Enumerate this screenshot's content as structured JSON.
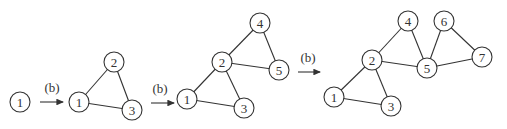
{
  "diagram": {
    "node_radius": 10,
    "stages": [
      {
        "nodes": [
          {
            "id": "1",
            "label": "1",
            "x": 20,
            "y": 102
          }
        ],
        "edges": []
      },
      {
        "nodes": [
          {
            "id": "1",
            "label": "1",
            "x": 79,
            "y": 102
          },
          {
            "id": "2",
            "label": "2",
            "x": 114,
            "y": 62
          },
          {
            "id": "3",
            "label": "3",
            "x": 132,
            "y": 110
          }
        ],
        "edges": [
          [
            "1",
            "2"
          ],
          [
            "2",
            "3"
          ],
          [
            "1",
            "3"
          ]
        ]
      },
      {
        "nodes": [
          {
            "id": "1",
            "label": "1",
            "x": 187,
            "y": 99
          },
          {
            "id": "2",
            "label": "2",
            "x": 222,
            "y": 62
          },
          {
            "id": "3",
            "label": "3",
            "x": 244,
            "y": 108
          },
          {
            "id": "4",
            "label": "4",
            "x": 260,
            "y": 23
          },
          {
            "id": "5",
            "label": "5",
            "x": 279,
            "y": 70
          }
        ],
        "edges": [
          [
            "1",
            "2"
          ],
          [
            "2",
            "3"
          ],
          [
            "1",
            "3"
          ],
          [
            "2",
            "4"
          ],
          [
            "4",
            "5"
          ],
          [
            "2",
            "5"
          ]
        ]
      },
      {
        "nodes": [
          {
            "id": "1",
            "label": "1",
            "x": 334,
            "y": 97
          },
          {
            "id": "2",
            "label": "2",
            "x": 372,
            "y": 60
          },
          {
            "id": "3",
            "label": "3",
            "x": 391,
            "y": 106
          },
          {
            "id": "4",
            "label": "4",
            "x": 408,
            "y": 21
          },
          {
            "id": "5",
            "label": "5",
            "x": 427,
            "y": 68
          },
          {
            "id": "6",
            "label": "6",
            "x": 444,
            "y": 21
          },
          {
            "id": "7",
            "label": "7",
            "x": 482,
            "y": 57
          }
        ],
        "edges": [
          [
            "1",
            "2"
          ],
          [
            "2",
            "3"
          ],
          [
            "1",
            "3"
          ],
          [
            "2",
            "4"
          ],
          [
            "4",
            "5"
          ],
          [
            "2",
            "5"
          ],
          [
            "5",
            "6"
          ],
          [
            "6",
            "7"
          ],
          [
            "5",
            "7"
          ]
        ]
      }
    ],
    "arrows": [
      {
        "label": "(b)",
        "x1": 40,
        "x2": 63,
        "y": 102,
        "lx": 52,
        "ly": 92
      },
      {
        "label": "(b)",
        "x1": 151,
        "x2": 174,
        "y": 103,
        "lx": 160,
        "ly": 93
      },
      {
        "label": "(b)",
        "x1": 298,
        "x2": 320,
        "y": 72,
        "lx": 308,
        "ly": 62
      }
    ]
  }
}
